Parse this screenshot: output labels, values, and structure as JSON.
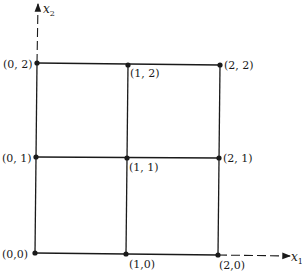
{
  "diagram": {
    "type": "lattice-grid",
    "axes": {
      "x": {
        "label": "x",
        "subscript": "1"
      },
      "y": {
        "label": "x",
        "subscript": "2"
      }
    },
    "points": [
      {
        "id": "p00",
        "label": "(0,0)",
        "x": 35,
        "y": 253,
        "lx": 2,
        "ly": 258,
        "anchor": "start"
      },
      {
        "id": "p10",
        "label": "(1,0)",
        "x": 126,
        "y": 254,
        "lx": 129,
        "ly": 268,
        "anchor": "start"
      },
      {
        "id": "p20",
        "label": "(2,0)",
        "x": 218,
        "y": 255,
        "lx": 219,
        "ly": 269,
        "anchor": "start"
      },
      {
        "id": "p01",
        "label": "(0, 1)",
        "x": 36,
        "y": 157,
        "lx": 2,
        "ly": 162,
        "anchor": "start"
      },
      {
        "id": "p11",
        "label": "(1, 1)",
        "x": 127,
        "y": 158,
        "lx": 129,
        "ly": 171,
        "anchor": "start"
      },
      {
        "id": "p21",
        "label": "(2, 1)",
        "x": 219,
        "y": 158,
        "lx": 223,
        "ly": 162,
        "anchor": "start"
      },
      {
        "id": "p02",
        "label": "(0, 2)",
        "x": 37,
        "y": 63,
        "lx": 3,
        "ly": 68,
        "anchor": "start"
      },
      {
        "id": "p12",
        "label": "(1, 2)",
        "x": 128,
        "y": 65,
        "lx": 130,
        "ly": 77,
        "anchor": "start"
      },
      {
        "id": "p22",
        "label": "(2, 2)",
        "x": 220,
        "y": 65,
        "lx": 224,
        "ly": 69,
        "anchor": "start"
      }
    ]
  }
}
